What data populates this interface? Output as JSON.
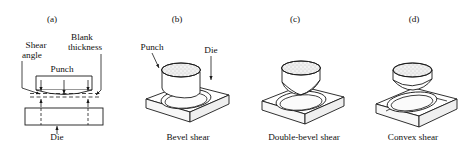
{
  "figure": {
    "background": "#ffffff",
    "line_color": "#1a1a1a",
    "fill_color": "#ffffff",
    "shade_color": "#e8e8e8"
  },
  "panels": [
    {
      "id": "a",
      "letter": "(a)",
      "caption": "",
      "labels": {
        "shear_angle": "Shear\nangle",
        "shear_angle_line1": "Shear",
        "shear_angle_line2": "angle",
        "blank_thickness_line1": "Blank",
        "blank_thickness_line2": "thickness",
        "punch": "Punch",
        "die": "Die"
      }
    },
    {
      "id": "b",
      "letter": "(b)",
      "caption": "Bevel shear",
      "labels": {
        "punch": "Punch",
        "die": "Die"
      }
    },
    {
      "id": "c",
      "letter": "(c)",
      "caption": "Double-bevel shear",
      "labels": {}
    },
    {
      "id": "d",
      "letter": "(d)",
      "caption": "Convex shear",
      "labels": {}
    }
  ]
}
